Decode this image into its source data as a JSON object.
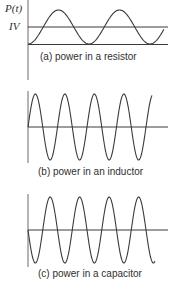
{
  "panels": [
    {
      "id": "a",
      "caption": "(a) power in a resistor",
      "y_axis_label": "P(t)",
      "reference_label": "IV",
      "waveform": "sinusoid offset above zero, oscillating between 0 and 2·IV (average IV)",
      "cycles_shown": 2.25
    },
    {
      "id": "b",
      "caption": "(b) power in an inductor",
      "waveform": "sinusoid centered on zero, starting downward (average 0)",
      "cycles_shown": 4.25
    },
    {
      "id": "c",
      "caption": "(c) power in a capacitor",
      "waveform": "sinusoid centered on zero, starting upward (average 0)",
      "cycles_shown": 4.25
    }
  ],
  "colors": {
    "line": "#3a3a3a",
    "axis": "#6a6a6a",
    "background": "#ffffff"
  }
}
